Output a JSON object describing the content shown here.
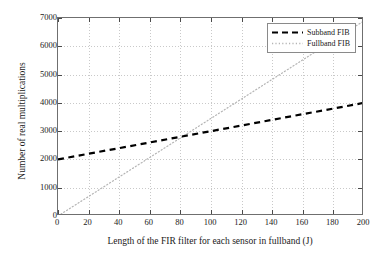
{
  "chart_data": {
    "type": "line",
    "title": "",
    "xlabel": "Length of the FIR filter for each sensor in fullband (J)",
    "ylabel": "Number of real multiplications",
    "xlim": [
      0,
      200
    ],
    "ylim": [
      0,
      7000
    ],
    "xticks": [
      0,
      20,
      40,
      60,
      80,
      100,
      120,
      140,
      160,
      180,
      200
    ],
    "yticks": [
      0,
      1000,
      2000,
      3000,
      4000,
      5000,
      6000,
      7000
    ],
    "xtick_labels": [
      "0",
      "20",
      "40",
      "60",
      "80",
      "100",
      "120",
      "140",
      "160",
      "180",
      "200"
    ],
    "ytick_labels": [
      "0",
      "1000",
      "2000",
      "3000",
      "4000",
      "5000",
      "6000",
      "7000"
    ],
    "grid": true,
    "legend_position": "top-right",
    "series": [
      {
        "name": "Subband FIB",
        "style": "dashed",
        "color": "#000000",
        "width": 2.2,
        "x": [
          0,
          200
        ],
        "values": [
          2000,
          4000
        ],
        "points": [
          {
            "x": 0,
            "y": 2000
          },
          {
            "x": 20,
            "y": 2200
          },
          {
            "x": 40,
            "y": 2400
          },
          {
            "x": 60,
            "y": 2600
          },
          {
            "x": 80,
            "y": 2800
          },
          {
            "x": 100,
            "y": 3000
          },
          {
            "x": 120,
            "y": 3200
          },
          {
            "x": 140,
            "y": 3400
          },
          {
            "x": 160,
            "y": 3600
          },
          {
            "x": 180,
            "y": 3800
          },
          {
            "x": 200,
            "y": 4000
          }
        ]
      },
      {
        "name": "Fullband FIB",
        "style": "dotted",
        "color": "#b4b4b4",
        "width": 1.2,
        "x": [
          0,
          200
        ],
        "values": [
          0,
          6900
        ],
        "points": [
          {
            "x": 0,
            "y": 0
          },
          {
            "x": 20,
            "y": 690
          },
          {
            "x": 40,
            "y": 1380
          },
          {
            "x": 60,
            "y": 2070
          },
          {
            "x": 80,
            "y": 2760
          },
          {
            "x": 100,
            "y": 3450
          },
          {
            "x": 120,
            "y": 4140
          },
          {
            "x": 140,
            "y": 4830
          },
          {
            "x": 160,
            "y": 5520
          },
          {
            "x": 180,
            "y": 6210
          },
          {
            "x": 200,
            "y": 6900
          }
        ]
      }
    ],
    "intersection": {
      "x": 103,
      "y": 3030
    },
    "legend": [
      {
        "label": "Subband FIB",
        "style": "dashed",
        "color": "#000000"
      },
      {
        "label": "Fullband FIB",
        "style": "dotted",
        "color": "#b4b4b4"
      }
    ],
    "axis_color": "#6f6f6f",
    "grid_color": "#c9c9c9",
    "background": "#ffffff"
  }
}
